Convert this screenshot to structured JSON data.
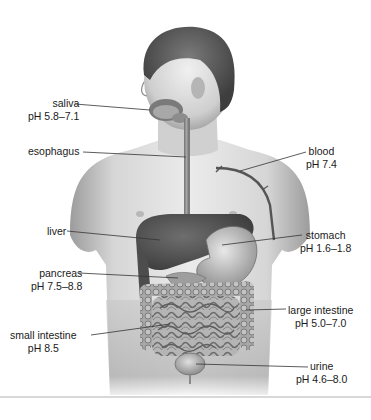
{
  "figure": {
    "labels": [
      {
        "id": "saliva",
        "name": "saliva",
        "ph": "pH 5.8–7.1",
        "side": "left"
      },
      {
        "id": "esophagus",
        "name": "esophagus",
        "ph": "",
        "side": "left"
      },
      {
        "id": "blood",
        "name": "blood",
        "ph": "pH 7.4",
        "side": "right"
      },
      {
        "id": "liver",
        "name": "liver",
        "ph": "",
        "side": "left"
      },
      {
        "id": "stomach",
        "name": "stomach",
        "ph": "pH 1.6–1.8",
        "side": "right"
      },
      {
        "id": "pancreas",
        "name": "pancreas",
        "ph": "pH 7.5–8.8",
        "side": "left"
      },
      {
        "id": "large-intestine",
        "name": "large intestine",
        "ph": "pH 5.0–7.0",
        "side": "right"
      },
      {
        "id": "small-intestine",
        "name": "small intestine",
        "ph": "pH 8.5",
        "side": "left"
      },
      {
        "id": "urine",
        "name": "urine",
        "ph": "pH 4.6–8.0",
        "side": "right"
      }
    ]
  },
  "colors": {
    "skin_light": "#e6e6e6",
    "skin_mid": "#bdbdbd",
    "skin_dark": "#8a8a8a",
    "hair": "#5a5a5a",
    "organ_dark": "#4a4a4a",
    "organ_mid": "#8f8f8f",
    "leader_line": "#333333",
    "divider": "#d8d8d8"
  }
}
